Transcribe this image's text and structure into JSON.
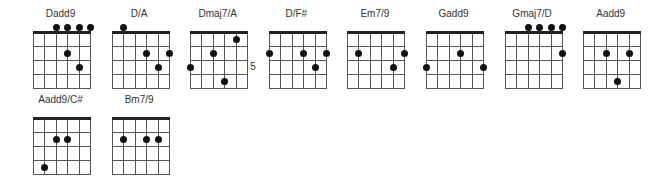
{
  "diagram": {
    "type": "guitar-chord-chart",
    "strings": 6,
    "frets_shown": 4,
    "colors": {
      "line": "#555555",
      "nut": "#222222",
      "dot": "#111111",
      "text": "#333333"
    },
    "chords": [
      {
        "name": "Dadd9",
        "row": 0,
        "col": 0,
        "open_strings": [
          3,
          4,
          5,
          6
        ],
        "fret_label": null,
        "dots": [
          {
            "string": 4,
            "fret": 2
          },
          {
            "string": 5,
            "fret": 3
          }
        ]
      },
      {
        "name": "D/A",
        "row": 0,
        "col": 1,
        "open_strings": [
          2
        ],
        "fret_label": null,
        "dots": [
          {
            "string": 4,
            "fret": 2
          },
          {
            "string": 6,
            "fret": 2
          },
          {
            "string": 5,
            "fret": 3
          }
        ]
      },
      {
        "name": "Dmaj7/A",
        "row": 0,
        "col": 2,
        "open_strings": [],
        "fret_label": {
          "text": "5",
          "fret": 3
        },
        "dots": [
          {
            "string": 5,
            "fret": 1
          },
          {
            "string": 3,
            "fret": 2
          },
          {
            "string": 1,
            "fret": 3
          },
          {
            "string": 4,
            "fret": 4
          }
        ]
      },
      {
        "name": "D/F#",
        "row": 0,
        "col": 3,
        "open_strings": [],
        "fret_label": null,
        "dots": [
          {
            "string": 1,
            "fret": 2
          },
          {
            "string": 4,
            "fret": 2
          },
          {
            "string": 6,
            "fret": 2
          },
          {
            "string": 5,
            "fret": 3
          }
        ]
      },
      {
        "name": "Em7/9",
        "row": 0,
        "col": 4,
        "open_strings": [],
        "fret_label": null,
        "dots": [
          {
            "string": 2,
            "fret": 2
          },
          {
            "string": 6,
            "fret": 2
          },
          {
            "string": 5,
            "fret": 3
          }
        ]
      },
      {
        "name": "Gadd9",
        "row": 0,
        "col": 5,
        "open_strings": [],
        "fret_label": null,
        "dots": [
          {
            "string": 4,
            "fret": 2
          },
          {
            "string": 1,
            "fret": 3
          },
          {
            "string": 6,
            "fret": 3
          }
        ]
      },
      {
        "name": "Gmaj7/D",
        "row": 0,
        "col": 6,
        "open_strings": [
          3,
          4,
          5,
          6
        ],
        "fret_label": null,
        "dots": [
          {
            "string": 6,
            "fret": 2
          }
        ]
      },
      {
        "name": "Aadd9",
        "row": 0,
        "col": 7,
        "open_strings": [],
        "fret_label": null,
        "dots": [
          {
            "string": 3,
            "fret": 2
          },
          {
            "string": 5,
            "fret": 2
          },
          {
            "string": 4,
            "fret": 4
          }
        ]
      },
      {
        "name": "Aadd9/C#",
        "row": 1,
        "col": 0,
        "open_strings": [],
        "fret_label": null,
        "dots": [
          {
            "string": 3,
            "fret": 2
          },
          {
            "string": 4,
            "fret": 2
          },
          {
            "string": 2,
            "fret": 4
          }
        ]
      },
      {
        "name": "Bm7/9",
        "row": 1,
        "col": 1,
        "open_strings": [],
        "fret_label": null,
        "dots": [
          {
            "string": 2,
            "fret": 2
          },
          {
            "string": 4,
            "fret": 2
          },
          {
            "string": 5,
            "fret": 2
          }
        ]
      }
    ]
  }
}
